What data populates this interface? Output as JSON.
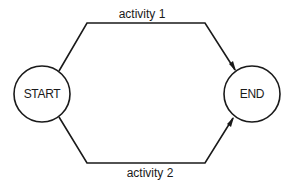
{
  "diagram": {
    "type": "activity-network",
    "nodes": [
      {
        "id": "start",
        "label": "START",
        "cx": 42,
        "cy": 94,
        "r": 28
      },
      {
        "id": "end",
        "label": "END",
        "cx": 252,
        "cy": 94,
        "r": 28
      }
    ],
    "edges": [
      {
        "id": "activity-1",
        "label": "activity 1",
        "from": "start",
        "to": "end",
        "path": "M 59 71 L 87 23 L 205 23 L 235 70",
        "label_x": 142,
        "label_y": 14
      },
      {
        "id": "activity-2",
        "label": "activity 2",
        "from": "start",
        "to": "end",
        "path": "M 59 117 L 87 163 L 205 163 L 233 118",
        "label_x": 150,
        "label_y": 173
      }
    ],
    "colors": {
      "stroke": "#1a1a1a",
      "background": "#ffffff"
    }
  }
}
